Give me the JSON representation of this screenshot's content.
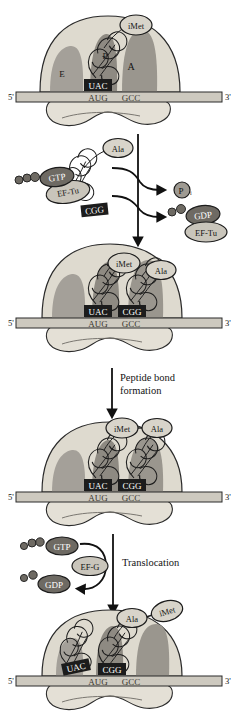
{
  "figure": {
    "background": "#ffffff",
    "colors": {
      "ribosome_large": "#dedacf",
      "ribosome_small": "#e4e0d6",
      "site_shade": "#9e9a92",
      "site_shade_dark": "#8a867e",
      "mrna": "#cdc9bf",
      "anticodon_box": "#1c1c1c",
      "anticodon_text": "#ffffff",
      "factor_dark": "#6e6a63",
      "factor_light": "#c9c5bb",
      "aminoacid_fill": "#d8d4ca",
      "outline": "#1c1c1c",
      "text": "#141414"
    },
    "mrna_labels": {
      "five_prime": "5'",
      "three_prime": "3'"
    },
    "codons": [
      "AUG",
      "GCC"
    ]
  },
  "panels": [
    {
      "id": "panel-initiation",
      "name": "ribosome-with-initiator-trna",
      "sites": [
        {
          "label": "E",
          "x": 62,
          "y": 73
        },
        {
          "label": "P",
          "x": 104,
          "y": 57
        },
        {
          "label": "A",
          "x": 129,
          "y": 68
        }
      ],
      "anticodons": [
        {
          "text": "UAC",
          "site": "P"
        }
      ],
      "amino_acids": [
        {
          "text": "iMet",
          "site": "P"
        }
      ],
      "mrna": {
        "five_prime": "5'",
        "three_prime": "3'",
        "codons": [
          "AUG",
          "GCC"
        ]
      }
    },
    {
      "id": "panel-ef-tu-delivery",
      "name": "ef-tu-ternary-complex",
      "complex": {
        "gtp_label": "GTP",
        "factor_label": "EF-Tu",
        "anticodon": "CGG",
        "amino_acid": "Ala"
      },
      "products": [
        {
          "label": "P",
          "subscript": "i",
          "name": "inorganic-phosphate"
        },
        {
          "label": "GDP",
          "name": "gdp"
        },
        {
          "label": "EF-Tu",
          "name": "ef-tu-released"
        }
      ]
    },
    {
      "id": "panel-both-trnas-bound",
      "name": "ribosome-with-two-trnas",
      "anticodons": [
        {
          "text": "UAC",
          "site": "P"
        },
        {
          "text": "CGG",
          "site": "A"
        }
      ],
      "amino_acids": [
        {
          "text": "iMet",
          "site": "P"
        },
        {
          "text": "Ala",
          "site": "A"
        }
      ],
      "mrna": {
        "five_prime": "5'",
        "three_prime": "3'",
        "codons": [
          "AUG",
          "GCC"
        ]
      }
    },
    {
      "id": "panel-after-peptide-bond",
      "name": "ribosome-after-peptide-bond",
      "anticodons": [
        {
          "text": "UAC",
          "site": "P"
        },
        {
          "text": "CGG",
          "site": "A"
        }
      ],
      "amino_acids": [
        {
          "text": "iMet",
          "site": "P"
        },
        {
          "text": "Ala",
          "site": "A"
        }
      ],
      "mrna": {
        "five_prime": "5'",
        "three_prime": "3'",
        "codons": [
          "AUG",
          "GCC"
        ]
      }
    },
    {
      "id": "panel-after-translocation",
      "name": "ribosome-after-translocation",
      "anticodons": [
        {
          "text": "UAC",
          "site": "E"
        },
        {
          "text": "CGG",
          "site": "P"
        }
      ],
      "amino_acids": [
        {
          "text": "Ala",
          "site": "P"
        },
        {
          "text": "iMet",
          "site": "P"
        }
      ],
      "mrna": {
        "five_prime": "5'",
        "three_prime": "3'",
        "codons": [
          "AUG",
          "GCC"
        ]
      }
    }
  ],
  "steps": [
    {
      "id": "step-peptide-bond",
      "name": "peptide-bond-formation",
      "label_line1": "Peptide bond",
      "label_line2": "formation"
    },
    {
      "id": "step-translocation",
      "name": "translocation",
      "label": "Translocation",
      "gtp_label": "GTP",
      "factor_label": "EF-G",
      "gdp_label": "GDP"
    }
  ]
}
